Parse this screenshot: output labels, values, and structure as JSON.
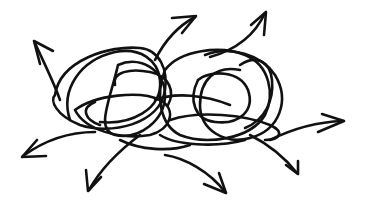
{
  "illustration": {
    "subject": "tangled scribble with arrows pointing outward",
    "style": "hand-drawn ink line art",
    "ink_color": "#111111",
    "background_color": "#ffffff",
    "arrow_count": 8,
    "arrow_directions": [
      "up-left",
      "up-right",
      "up-right",
      "left",
      "down-left",
      "down-right",
      "down-right",
      "right"
    ]
  }
}
